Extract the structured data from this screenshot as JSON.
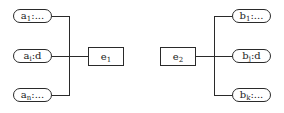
{
  "diagram": {
    "left_group": {
      "entity": {
        "base": "e",
        "sub": "1"
      },
      "attributes": [
        {
          "base": "a",
          "sub": "1",
          "suffix": ":..."
        },
        {
          "base": "a",
          "sub": "i",
          "suffix": ":d"
        },
        {
          "base": "a",
          "sub": "n",
          "suffix": ":..."
        }
      ]
    },
    "right_group": {
      "entity": {
        "base": "e",
        "sub": "2"
      },
      "attributes": [
        {
          "base": "b",
          "sub": "1",
          "suffix": ":..."
        },
        {
          "base": "b",
          "sub": "j",
          "suffix": ":d"
        },
        {
          "base": "b",
          "sub": "k",
          "suffix": ":..."
        }
      ]
    },
    "colors": {
      "stroke": "#2a2a2a",
      "background": "#ffffff",
      "text": "#1a1a1a"
    }
  }
}
